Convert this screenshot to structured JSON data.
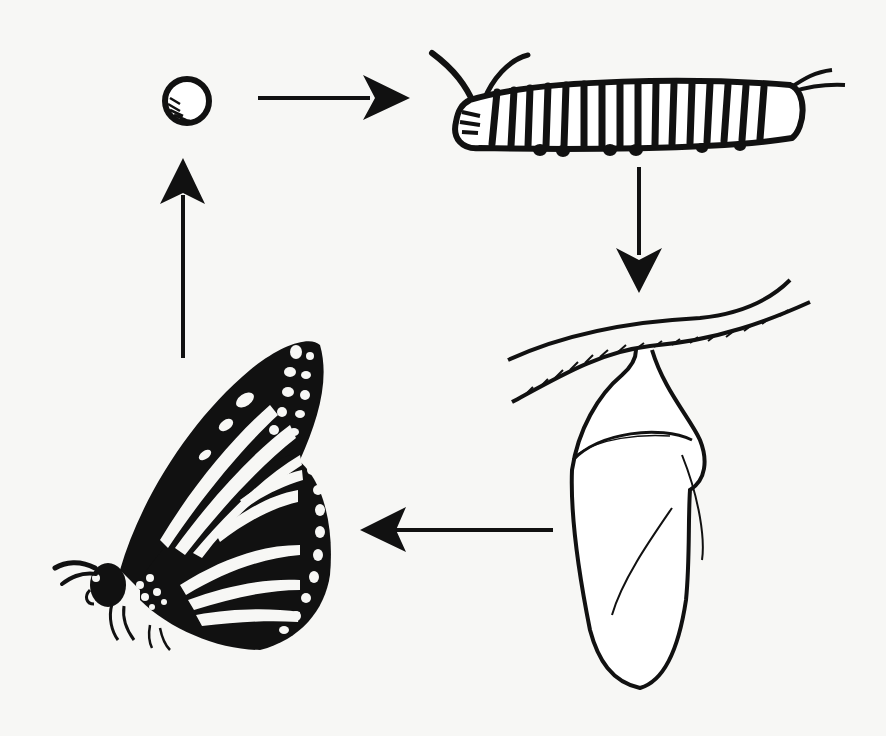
{
  "diagram": {
    "title": "Monarch butterfly life cycle",
    "layout": "clockwise cycle",
    "stages": [
      {
        "id": "egg",
        "label": "Egg",
        "position": "top-left"
      },
      {
        "id": "caterpillar",
        "label": "Caterpillar (larva)",
        "position": "top-right"
      },
      {
        "id": "chrysalis",
        "label": "Chrysalis (pupa)",
        "position": "bottom-right"
      },
      {
        "id": "butterfly",
        "label": "Adult butterfly",
        "position": "bottom-left"
      }
    ],
    "arrows": [
      {
        "from": "egg",
        "to": "caterpillar",
        "direction": "right"
      },
      {
        "from": "caterpillar",
        "to": "chrysalis",
        "direction": "down"
      },
      {
        "from": "chrysalis",
        "to": "butterfly",
        "direction": "left"
      },
      {
        "from": "butterfly",
        "to": "egg",
        "direction": "up"
      }
    ],
    "colors": {
      "ink": "#111111",
      "paper": "#f7f7f5"
    }
  }
}
